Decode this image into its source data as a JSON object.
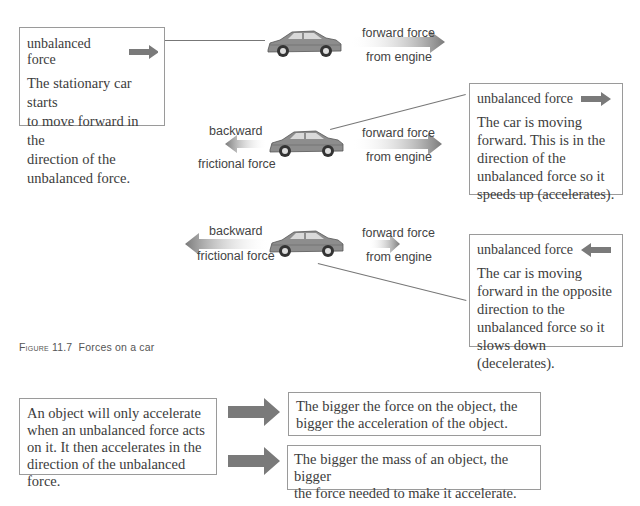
{
  "top_clip_text": "",
  "scenarios": [
    {
      "id": "stationary",
      "box": {
        "heading": "unbalanced force",
        "arrow_direction": "right",
        "body": [
          "The stationary car starts",
          "to move forward in the",
          "direction of the",
          "unbalanced force."
        ]
      },
      "labels": {
        "forward_top": "forward force",
        "forward_bottom": "from engine"
      }
    },
    {
      "id": "accelerating",
      "box": {
        "heading": "unbalanced force",
        "arrow_direction": "right",
        "body": [
          "The car is moving",
          "forward. This is in the",
          "direction of the",
          "unbalanced force so it",
          "speeds up (accelerates)."
        ]
      },
      "labels": {
        "backward_top": "backward",
        "backward_bottom": "frictional force",
        "forward_top": "forward force",
        "forward_bottom": "from engine"
      }
    },
    {
      "id": "decelerating",
      "box": {
        "heading": "unbalanced force",
        "arrow_direction": "left",
        "body": [
          "The car is moving",
          "forward in the opposite",
          "direction to the",
          "unbalanced force so it",
          "slows down (decelerates)."
        ]
      },
      "labels": {
        "backward_top": "backward",
        "backward_bottom": "frictional force",
        "forward_top": "forward force",
        "forward_bottom": "from engine"
      }
    }
  ],
  "caption": {
    "figure_label": "Figure 11.7",
    "text": "Forces on a car"
  },
  "summary": {
    "left": [
      "An object will only accelerate",
      "when an unbalanced force acts",
      "on it. It then accelerates in the",
      "direction of the unbalanced force."
    ],
    "right": [
      [
        "The bigger the force on the object, the",
        "bigger the acceleration of the object."
      ],
      [
        "The bigger the mass of an object, the bigger",
        "the force needed to make it accelerate."
      ]
    ]
  },
  "colors": {
    "arrow_solid": "#7a7a7a",
    "box_border": "#9a9a9a",
    "car_body": "#8c8c8c",
    "connector_line": "#777777"
  }
}
